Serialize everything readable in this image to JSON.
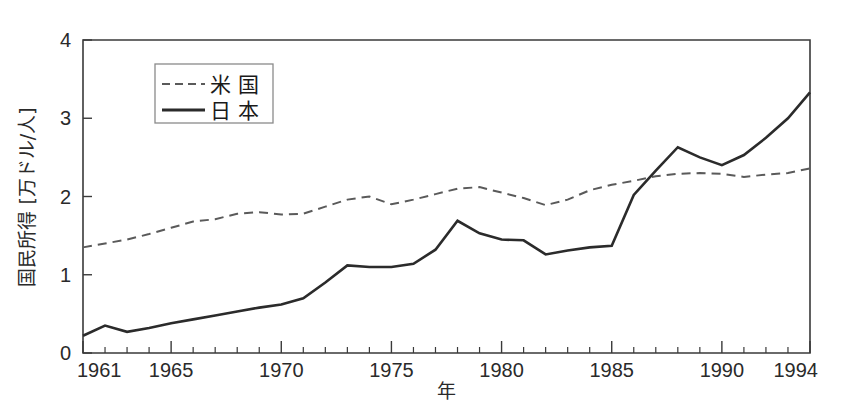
{
  "chart_data": {
    "type": "line",
    "title": "",
    "xlabel": "年",
    "ylabel": "国民所得 [万ドル/人]",
    "xlim": [
      1961,
      1994
    ],
    "ylim": [
      0,
      4
    ],
    "yticks": [
      "0",
      "1",
      "2",
      "3",
      "4"
    ],
    "ytick_values": [
      0,
      1,
      2,
      3,
      4
    ],
    "xticks_labeled": [
      "1961",
      "1965",
      "1970",
      "1975",
      "1980",
      "1985",
      "1990",
      "1994"
    ],
    "xtick_values": [
      1961,
      1965,
      1970,
      1975,
      1980,
      1985,
      1990,
      1994
    ],
    "xtick_minor_step": 1,
    "grid": false,
    "legend_position": "upper-left-inside",
    "x": [
      1961,
      1962,
      1963,
      1964,
      1965,
      1966,
      1967,
      1968,
      1969,
      1970,
      1971,
      1972,
      1973,
      1974,
      1975,
      1976,
      1977,
      1978,
      1979,
      1980,
      1981,
      1982,
      1983,
      1984,
      1985,
      1986,
      1987,
      1988,
      1989,
      1990,
      1991,
      1992,
      1993,
      1994
    ],
    "series": [
      {
        "name": "米 国",
        "label": "米 国",
        "style": "dashed",
        "color": "#5a5a5a",
        "values": [
          1.35,
          1.4,
          1.45,
          1.52,
          1.6,
          1.68,
          1.71,
          1.78,
          1.8,
          1.77,
          1.78,
          1.87,
          1.96,
          2.0,
          1.9,
          1.96,
          2.03,
          2.1,
          2.12,
          2.05,
          1.98,
          1.89,
          1.96,
          2.08,
          2.15,
          2.2,
          2.26,
          2.29,
          2.3,
          2.29,
          2.25,
          2.28,
          2.3,
          2.36
        ]
      },
      {
        "name": "日 本",
        "label": "日 本",
        "style": "solid",
        "color": "#2b2b2b",
        "values": [
          0.22,
          0.35,
          0.27,
          0.32,
          0.38,
          0.43,
          0.48,
          0.53,
          0.58,
          0.62,
          0.7,
          0.9,
          1.12,
          1.1,
          1.1,
          1.14,
          1.32,
          1.69,
          1.53,
          1.45,
          1.44,
          1.26,
          1.31,
          1.35,
          1.37,
          2.02,
          2.33,
          2.63,
          2.5,
          2.4,
          2.53,
          2.75,
          3.0,
          3.33
        ]
      }
    ]
  },
  "legend": {
    "entries": [
      {
        "label": "米 国",
        "style": "dashed"
      },
      {
        "label": "日 本",
        "style": "solid"
      }
    ]
  },
  "axes": {
    "y_title": "国民所得 [万ドル/人]",
    "x_title": "年"
  }
}
